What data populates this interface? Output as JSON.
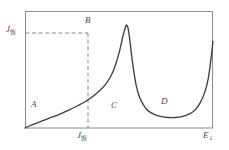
{
  "figure": {
    "background_color": "#ffffff",
    "line_color": "#3f3f3f",
    "frame_color": "#8c8c8c",
    "dash_color": "#8c8c8c"
  },
  "chart_data": {
    "type": "line",
    "title": "",
    "subtitle": "",
    "xlabel": "E",
    "xlabel_sub": "↓",
    "ylabel": "J",
    "ylabel_sub": "饱",
    "xlabel_full": "E↓",
    "ylabel_full": "J饱",
    "grid": false,
    "legend": "none",
    "xlim": [
      0,
      1
    ],
    "ylim": [
      0,
      1
    ],
    "x_ticks": [
      {
        "value": 0.54,
        "label": "E饱"
      }
    ],
    "y_ticks": [
      {
        "value": 0.82,
        "label": "J饱"
      }
    ],
    "annotations": [
      {
        "name": "A",
        "label": "A",
        "x": 0.06,
        "y": 0.2,
        "description": "rising low-field region"
      },
      {
        "name": "B",
        "label": "B",
        "x": 0.54,
        "y": 0.95,
        "description": "peak of curve at saturation field"
      },
      {
        "name": "C",
        "label": "C",
        "x": 0.46,
        "y": 0.2,
        "description": "shoulder after the sharp drop"
      },
      {
        "name": "D",
        "label": "D",
        "x": 0.73,
        "y": 0.24,
        "description": "start of final steep rise"
      }
    ],
    "reference_lines": [
      {
        "name": "saturation-horizontal",
        "orientation": "horizontal",
        "value": 0.82,
        "style": "dashed"
      },
      {
        "name": "saturation-vertical",
        "orientation": "vertical",
        "value": 0.54,
        "style": "dashed"
      }
    ],
    "series": [
      {
        "name": "current-density-curve",
        "x": [
          0.0,
          0.02,
          0.05,
          0.09,
          0.13,
          0.18,
          0.23,
          0.28,
          0.33,
          0.38,
          0.43,
          0.47,
          0.5,
          0.52,
          0.535,
          0.54,
          0.548,
          0.558,
          0.572,
          0.59,
          0.61,
          0.635,
          0.66,
          0.69,
          0.72,
          0.76,
          0.8,
          0.84,
          0.875,
          0.905,
          0.93,
          0.955,
          0.975,
          0.99,
          1.0
        ],
        "y": [
          0.0,
          0.015,
          0.035,
          0.06,
          0.085,
          0.115,
          0.15,
          0.19,
          0.235,
          0.295,
          0.375,
          0.49,
          0.64,
          0.78,
          0.865,
          0.88,
          0.855,
          0.745,
          0.56,
          0.375,
          0.26,
          0.185,
          0.14,
          0.115,
          0.1,
          0.09,
          0.09,
          0.1,
          0.12,
          0.155,
          0.21,
          0.3,
          0.425,
          0.6,
          0.74
        ]
      }
    ]
  },
  "axes": {
    "frame": {
      "left": 25,
      "top": 11,
      "right": 213,
      "bottom": 128
    }
  }
}
